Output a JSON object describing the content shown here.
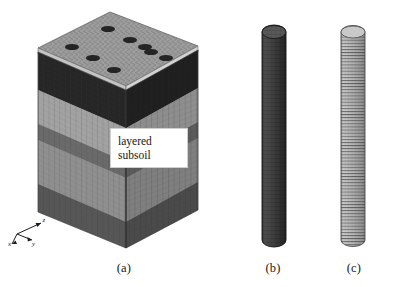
{
  "figure": {
    "domain": "scientific-figure",
    "background_color": "#ffffff",
    "width": 404,
    "height": 287
  },
  "panels": [
    {
      "id": "a",
      "caption": "(a)",
      "name": "layered-subsoil-block",
      "callout": {
        "line1": "layered",
        "line2": "subsoil"
      },
      "top_plate": {
        "name": "meshed-raft-plate",
        "hole_count": 9,
        "hole_grid": "3x3",
        "hole_color": "#242424",
        "mesh_color": "#9c9c9c"
      },
      "soil_layers": [
        {
          "index": 1,
          "name": "layer-1-dark",
          "color": "#2f2f2f",
          "side_color": "#262626"
        },
        {
          "index": 2,
          "name": "layer-2-light-gray",
          "color": "#a9a9a9",
          "side_color": "#8d8d8d"
        },
        {
          "index": 3,
          "name": "layer-3-mid-dark",
          "color": "#6e6e6e",
          "side_color": "#5c5c5c"
        },
        {
          "index": 4,
          "name": "layer-4-medium-gray",
          "color": "#969696",
          "side_color": "#7d7d7d"
        },
        {
          "index": 5,
          "name": "layer-5-dark-base",
          "color": "#5a5a5a",
          "side_color": "#4b4b4b"
        }
      ],
      "axis_triad": {
        "x_label": "x",
        "y_label": "y",
        "z_label": "z"
      }
    },
    {
      "id": "b",
      "caption": "(b)",
      "name": "pile-mesh-dark",
      "style": "dark solid cylindrical mesh",
      "color": "#3a3a3a",
      "mesh_color": "#1d1d1d"
    },
    {
      "id": "c",
      "caption": "(c)",
      "name": "pile-mesh-light-ringed",
      "style": "light cylindrical mesh with fine horizontal rings",
      "color": "#b6b6b6",
      "mesh_color": "#4a4a4a"
    }
  ],
  "colors": {
    "background": "#ffffff",
    "text": "#202020",
    "callout_background": "#ffffff",
    "callout_border": "#cfcfcf"
  }
}
